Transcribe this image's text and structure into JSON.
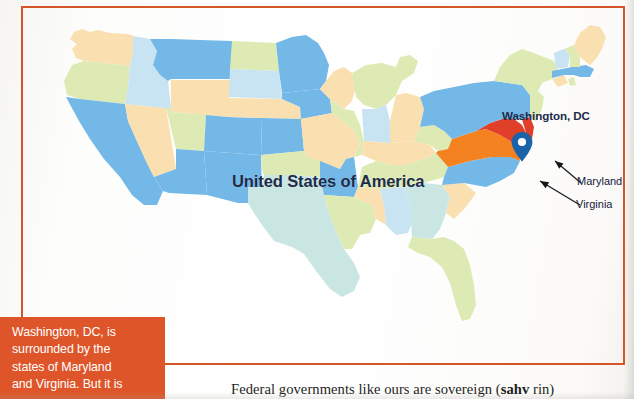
{
  "figure": {
    "frame_color": "#d65528",
    "map_title": "United States of America",
    "annotations": {
      "capital_label": "Washington, DC",
      "maryland_label": "Maryland",
      "virginia_label": "Virginia",
      "pin_color": "#1a63a8",
      "maryland_highlight_color": "#e0402a",
      "virginia_highlight_color": "#f58220"
    }
  },
  "callout": {
    "background_color": "#dd5529",
    "lines": [
      "Washington, DC, is",
      "surrounded by the",
      "states of Maryland",
      "and Virginia. But it is"
    ]
  },
  "body": {
    "paragraph_prefix": "Federal governments like ours are sovereign (",
    "pronunciation_bold": "sahv",
    "paragraph_suffix": " rin)"
  },
  "map_data": {
    "type": "choropleth",
    "region": "United States of America",
    "palette": {
      "pale_yellow": "#fae0b0",
      "pale_green": "#ddeab4",
      "light_blue": "#74b8e8",
      "pale_blue": "#c8e4f2",
      "pale_cyan": "#c9e6e3",
      "highlight_orange": "#f58220",
      "highlight_red": "#e0402a"
    },
    "states": [
      {
        "name": "Washington",
        "fill": "#fae0b0"
      },
      {
        "name": "Oregon",
        "fill": "#ddeab4"
      },
      {
        "name": "California",
        "fill": "#74b8e8"
      },
      {
        "name": "Nevada",
        "fill": "#fae0b0"
      },
      {
        "name": "Idaho",
        "fill": "#c8e4f2"
      },
      {
        "name": "Montana",
        "fill": "#74b8e8"
      },
      {
        "name": "Wyoming",
        "fill": "#fae0b0"
      },
      {
        "name": "Utah",
        "fill": "#ddeab4"
      },
      {
        "name": "Arizona",
        "fill": "#74b8e8"
      },
      {
        "name": "Colorado",
        "fill": "#74b8e8"
      },
      {
        "name": "New Mexico",
        "fill": "#74b8e8"
      },
      {
        "name": "North Dakota",
        "fill": "#ddeab4"
      },
      {
        "name": "South Dakota",
        "fill": "#c8e4f2"
      },
      {
        "name": "Nebraska",
        "fill": "#fae0b0"
      },
      {
        "name": "Kansas",
        "fill": "#74b8e8"
      },
      {
        "name": "Oklahoma",
        "fill": "#ddeab4"
      },
      {
        "name": "Texas",
        "fill": "#c9e6e3"
      },
      {
        "name": "Minnesota",
        "fill": "#74b8e8"
      },
      {
        "name": "Iowa",
        "fill": "#74b8e8"
      },
      {
        "name": "Missouri",
        "fill": "#fae0b0"
      },
      {
        "name": "Arkansas",
        "fill": "#74b8e8"
      },
      {
        "name": "Louisiana",
        "fill": "#ddeab4"
      },
      {
        "name": "Wisconsin",
        "fill": "#fae0b0"
      },
      {
        "name": "Illinois",
        "fill": "#ddeab4"
      },
      {
        "name": "Michigan",
        "fill": "#ddeab4"
      },
      {
        "name": "Indiana",
        "fill": "#c8e4f2"
      },
      {
        "name": "Ohio",
        "fill": "#fae0b0"
      },
      {
        "name": "Kentucky",
        "fill": "#fae0b0"
      },
      {
        "name": "Tennessee",
        "fill": "#ddeab4"
      },
      {
        "name": "Mississippi",
        "fill": "#fae0b0"
      },
      {
        "name": "Alabama",
        "fill": "#c8e4f2"
      },
      {
        "name": "Georgia",
        "fill": "#c9e6e3"
      },
      {
        "name": "Florida",
        "fill": "#ddeab4"
      },
      {
        "name": "South Carolina",
        "fill": "#fae0b0"
      },
      {
        "name": "North Carolina",
        "fill": "#74b8e8"
      },
      {
        "name": "Virginia",
        "fill": "#f58220"
      },
      {
        "name": "West Virginia",
        "fill": "#ddeab4"
      },
      {
        "name": "Maryland",
        "fill": "#e0402a"
      },
      {
        "name": "Delaware",
        "fill": "#e0402a"
      },
      {
        "name": "Pennsylvania",
        "fill": "#74b8e8"
      },
      {
        "name": "New Jersey",
        "fill": "#ddeab4"
      },
      {
        "name": "New York",
        "fill": "#ddeab4"
      },
      {
        "name": "Connecticut",
        "fill": "#fae0b0"
      },
      {
        "name": "Rhode Island",
        "fill": "#ddeab4"
      },
      {
        "name": "Massachusetts",
        "fill": "#74b8e8"
      },
      {
        "name": "Vermont",
        "fill": "#c8e4f2"
      },
      {
        "name": "New Hampshire",
        "fill": "#ddeab4"
      },
      {
        "name": "Maine",
        "fill": "#fae0b0"
      }
    ]
  }
}
